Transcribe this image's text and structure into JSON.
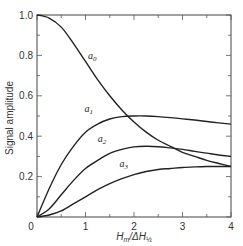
{
  "chart_data": {
    "type": "line",
    "title": "",
    "xlabel": "H_m/ΔH_½",
    "ylabel": "Signal amplitude",
    "xlim": [
      0,
      4
    ],
    "ylim": [
      0,
      1.0
    ],
    "grid": false,
    "legend": "inline curve labels",
    "x_ticks": [
      "0",
      "1",
      "2",
      "3",
      "4"
    ],
    "y_ticks": [
      "0.2",
      "0.4",
      "0.6",
      "0.8",
      "1.0"
    ],
    "x": [
      0,
      0.25,
      0.5,
      0.75,
      1.0,
      1.25,
      1.5,
      1.75,
      2.0,
      2.25,
      2.5,
      2.75,
      3.0,
      3.25,
      3.5,
      3.75,
      4.0
    ],
    "series": [
      {
        "name": "a0",
        "label_main": "a",
        "label_sub": "0",
        "values": [
          1.0,
          0.985,
          0.94,
          0.86,
          0.77,
          0.68,
          0.6,
          0.53,
          0.47,
          0.42,
          0.38,
          0.35,
          0.32,
          0.3,
          0.28,
          0.265,
          0.25
        ]
      },
      {
        "name": "a1",
        "label_main": "a",
        "label_sub": "1",
        "values": [
          0.0,
          0.14,
          0.26,
          0.35,
          0.42,
          0.46,
          0.485,
          0.497,
          0.5,
          0.5,
          0.497,
          0.492,
          0.486,
          0.48,
          0.473,
          0.466,
          0.46
        ]
      },
      {
        "name": "a2",
        "label_main": "a",
        "label_sub": "2",
        "values": [
          0.0,
          0.04,
          0.11,
          0.18,
          0.24,
          0.28,
          0.315,
          0.335,
          0.347,
          0.35,
          0.348,
          0.342,
          0.335,
          0.325,
          0.316,
          0.307,
          0.3
        ]
      },
      {
        "name": "a3",
        "label_main": "a",
        "label_sub": "3",
        "values": [
          0.0,
          0.01,
          0.03,
          0.065,
          0.1,
          0.135,
          0.165,
          0.19,
          0.21,
          0.225,
          0.235,
          0.24,
          0.245,
          0.248,
          0.25,
          0.25,
          0.25
        ]
      }
    ],
    "annotations": [
      {
        "text": "a0",
        "x": 1.05,
        "y": 0.78
      },
      {
        "text": "a1",
        "x": 0.98,
        "y": 0.52
      },
      {
        "text": "a2",
        "x": 1.25,
        "y": 0.37
      },
      {
        "text": "a3",
        "x": 1.7,
        "y": 0.25
      }
    ]
  },
  "axes": {
    "x_label_main": "H",
    "x_label_sub": "m",
    "x_label_mid": "/ΔH",
    "x_label_sub2": "½",
    "y_label": "Signal amplitude",
    "origin_label": "0"
  }
}
